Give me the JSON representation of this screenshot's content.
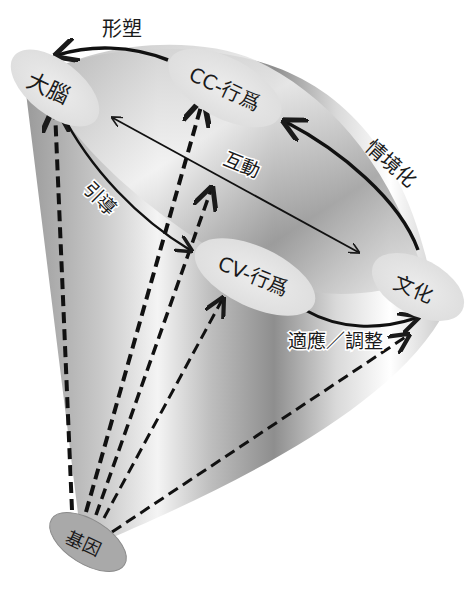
{
  "diagram": {
    "type": "cone-relationship-diagram",
    "nodes": {
      "brain": "大腦",
      "cc_behavior": "CC-行爲",
      "cv_behavior": "CV-行爲",
      "culture": "文化",
      "gene": "基因"
    },
    "edges": {
      "shaping": "形塑",
      "contextualization": "情境化",
      "interaction": "互動",
      "guidance": "引導",
      "adaptation_adjustment": "適應／調整"
    },
    "colors": {
      "node_fill": "#e6e6e6",
      "gene_fill": "#a8a8a8",
      "arrow": "#1a1a1a",
      "cone_dark": "#8c8c8c",
      "cone_light": "#ffffff"
    }
  }
}
